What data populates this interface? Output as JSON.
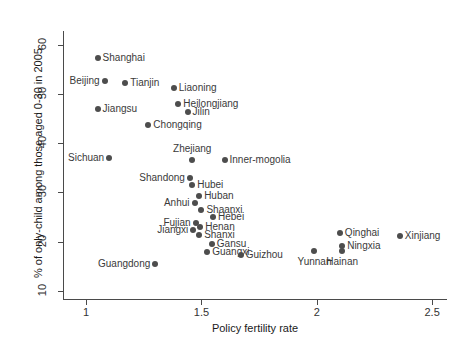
{
  "chart_data": {
    "type": "scatter",
    "title": "",
    "xlabel": "Policy fertility rate",
    "ylabel": "% of only-child among those aged 0-30 in 2005",
    "xlim": [
      0.9,
      2.56
    ],
    "ylim": [
      8.5,
      62.5
    ],
    "xticks": [
      "1",
      "1.5",
      "2",
      "2.5"
    ],
    "xtick_values": [
      1,
      1.5,
      2,
      2.5
    ],
    "yticks": [
      "10",
      "20",
      "30",
      "40",
      "50",
      "60"
    ],
    "ytick_values": [
      10,
      20,
      30,
      40,
      50,
      60
    ],
    "grid": false,
    "legend": "none",
    "points": [
      {
        "label": "Shanghai",
        "x": 1.05,
        "y": 57.5,
        "pos": "right"
      },
      {
        "label": "Beijing",
        "x": 1.08,
        "y": 52.8,
        "pos": "left"
      },
      {
        "label": "Tianjin",
        "x": 1.17,
        "y": 52.4,
        "pos": "right"
      },
      {
        "label": "Liaoning",
        "x": 1.38,
        "y": 51.3,
        "pos": "right"
      },
      {
        "label": "Heilongjiang",
        "x": 1.4,
        "y": 48.0,
        "pos": "right"
      },
      {
        "label": "Jilin",
        "x": 1.44,
        "y": 46.5,
        "pos": "right"
      },
      {
        "label": "Jiangsu",
        "x": 1.05,
        "y": 47.0,
        "pos": "right"
      },
      {
        "label": "Chongqing",
        "x": 1.27,
        "y": 43.8,
        "pos": "right"
      },
      {
        "label": "Sichuan",
        "x": 1.1,
        "y": 37.1,
        "pos": "left"
      },
      {
        "label": "Zhejiang",
        "x": 1.46,
        "y": 36.7,
        "pos": "above"
      },
      {
        "label": "Inner-mogolia",
        "x": 1.6,
        "y": 36.7,
        "pos": "right"
      },
      {
        "label": "Shandong",
        "x": 1.45,
        "y": 33.0,
        "pos": "left"
      },
      {
        "label": "Hubei",
        "x": 1.46,
        "y": 31.5,
        "pos": "right"
      },
      {
        "label": "Huban",
        "x": 1.49,
        "y": 29.2,
        "pos": "right"
      },
      {
        "label": "Anhui",
        "x": 1.47,
        "y": 27.8,
        "pos": "left"
      },
      {
        "label": "Shaanxi",
        "x": 1.5,
        "y": 26.4,
        "pos": "right"
      },
      {
        "label": "Hebei",
        "x": 1.55,
        "y": 25.1,
        "pos": "right"
      },
      {
        "label": "Fujian",
        "x": 1.475,
        "y": 23.8,
        "pos": "left"
      },
      {
        "label": "Henan",
        "x": 1.495,
        "y": 23.0,
        "pos": "right"
      },
      {
        "label": "Jiangxi",
        "x": 1.465,
        "y": 22.4,
        "pos": "left"
      },
      {
        "label": "Shanxi",
        "x": 1.49,
        "y": 21.3,
        "pos": "right"
      },
      {
        "label": "Gansu",
        "x": 1.545,
        "y": 19.5,
        "pos": "right"
      },
      {
        "label": "Guangxi",
        "x": 1.525,
        "y": 17.9,
        "pos": "right"
      },
      {
        "label": "Guizhou",
        "x": 1.67,
        "y": 17.3,
        "pos": "right"
      },
      {
        "label": "Guangdong",
        "x": 1.3,
        "y": 15.5,
        "pos": "left"
      },
      {
        "label": "Qinghai",
        "x": 2.1,
        "y": 21.8,
        "pos": "right"
      },
      {
        "label": "Xinjiang",
        "x": 2.36,
        "y": 21.2,
        "pos": "right"
      },
      {
        "label": "Ningxia",
        "x": 2.11,
        "y": 19.0,
        "pos": "right"
      },
      {
        "label": "Hainan",
        "x": 2.11,
        "y": 18.0,
        "pos": "below"
      },
      {
        "label": "Yunnan",
        "x": 1.99,
        "y": 18.1,
        "pos": "below"
      }
    ]
  }
}
